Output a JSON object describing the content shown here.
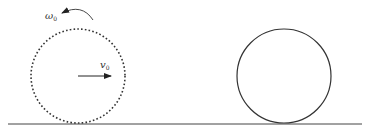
{
  "diagram": {
    "type": "physics-rolling-ball",
    "colors": {
      "stroke": "#3a3a3a",
      "background": "#ffffff"
    },
    "initial_ball": {
      "style": "dashed",
      "center": [
        78,
        75
      ],
      "radius": 47,
      "angular_velocity_label": "ω",
      "angular_velocity_sub": "0",
      "linear_velocity_label": "v",
      "linear_velocity_sub": "0",
      "rotation_direction": "counterclockwise",
      "velocity_direction": "right"
    },
    "final_ball": {
      "style": "solid",
      "center": [
        284,
        76
      ],
      "radius": 47
    },
    "ground": {
      "y": 124,
      "x1": 8,
      "x2": 362
    }
  }
}
